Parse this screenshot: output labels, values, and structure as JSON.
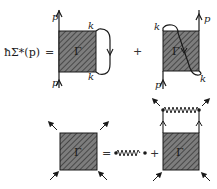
{
  "equation1": {
    "lhs": "ħΣ*(p)",
    "equals": "=",
    "plus": "+",
    "term1": {
      "vertex_label": "Γ",
      "external_labels": [
        "p",
        "p"
      ],
      "loop_labels": [
        "k",
        "k"
      ]
    },
    "term2": {
      "vertex_label": "Γ",
      "external_labels": [
        "p",
        "p"
      ],
      "loop_labels": [
        "k",
        "k"
      ]
    }
  },
  "equation2": {
    "equals": "=",
    "plus": "+",
    "lhs_vertex_label": "Γ",
    "rhs_vertex_label": "Γ"
  },
  "colors": {
    "box_fill": "#7a7a7a",
    "hatch": "#3a3a3a",
    "line": "#1a1a1a"
  }
}
